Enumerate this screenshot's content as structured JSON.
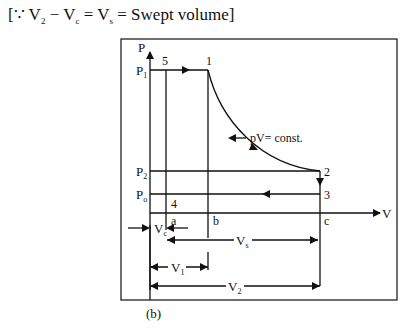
{
  "equation": {
    "prefix": "[∵ V",
    "v2_sub": "2",
    "minus": " − V",
    "vc_sub": "c",
    "eq1": " = V",
    "vs_sub": "s",
    "suffix": " = Swept volume]"
  },
  "diagram": {
    "caption": "(b)",
    "axes": {
      "y_label": "P",
      "x_label": "V"
    },
    "pressure_labels": {
      "p1": "P",
      "p1_sub": "1",
      "p2": "P",
      "p2_sub": "2",
      "po": "P",
      "po_sub": "o"
    },
    "points": {
      "p1": "1",
      "p2": "2",
      "p3": "3",
      "p4": "4",
      "p5": "5"
    },
    "axis_points": {
      "a": "a",
      "b": "b",
      "c": "c"
    },
    "annotation": "pV= const.",
    "dimensions": {
      "vc": "V",
      "vc_sub": "c",
      "vs": "V",
      "vs_sub": "s",
      "v1": "V",
      "v1_sub": "1",
      "v2": "V",
      "v2_sub": "2"
    }
  }
}
